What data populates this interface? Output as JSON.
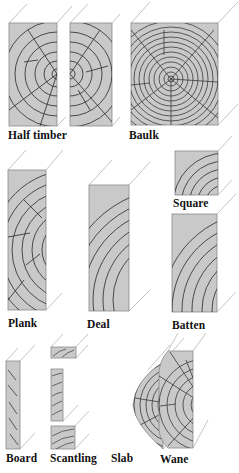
{
  "diagram": {
    "colors": {
      "wood_face": "#c9c9c9",
      "grain_line": "#3a3a3a",
      "edge_line": "#8a8a8a",
      "perspective_line": "#b5b5b5",
      "label_text": "#111111",
      "background": "#ffffff"
    },
    "labels": {
      "half_timber": "Half timber",
      "baulk": "Baulk",
      "square": "Square",
      "plank": "Plank",
      "deal": "Deal",
      "batten": "Batten",
      "board": "Board",
      "scantling": "Scantling",
      "slab": "Slab",
      "wane": "Wane"
    },
    "rows": [
      {
        "row": 1,
        "items": [
          "half_timber",
          "baulk"
        ]
      },
      {
        "row": 2,
        "items": [
          "plank",
          "deal",
          "square",
          "batten"
        ]
      },
      {
        "row": 3,
        "items": [
          "board",
          "scantling",
          "slab",
          "wane"
        ]
      }
    ]
  }
}
